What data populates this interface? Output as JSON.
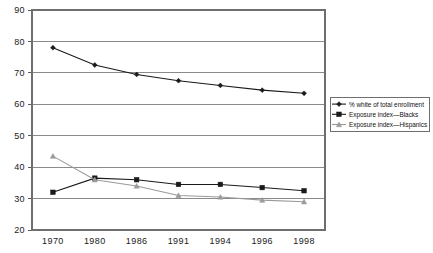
{
  "chart_data": {
    "type": "line",
    "title": "",
    "subtitle": "",
    "xlabel": "",
    "ylabel": "",
    "categories": [
      "1970",
      "1980",
      "1986",
      "1991",
      "1994",
      "1996",
      "1998"
    ],
    "ylim": [
      20,
      90
    ],
    "yticks": [
      "20",
      "30",
      "40",
      "50",
      "60",
      "70",
      "80",
      "90"
    ],
    "grid": true,
    "legend_position": "right",
    "series": [
      {
        "name": "% white of total enrollment",
        "marker": "diamond",
        "color": "#1a1a1a",
        "values": [
          78,
          72.5,
          69.5,
          67.5,
          66,
          64.5,
          63.5
        ]
      },
      {
        "name": "Exposure index—Blacks",
        "marker": "square",
        "color": "#1a1a1a",
        "values": [
          32,
          36.5,
          36,
          34.5,
          34.5,
          33.5,
          32.5
        ]
      },
      {
        "name": "Exposure index—Hispanics",
        "marker": "triangle",
        "color": "#9a9a9a",
        "values": [
          43.5,
          36,
          34,
          31,
          30.5,
          29.5,
          29
        ]
      }
    ]
  },
  "legend": {
    "items": [
      {
        "label": "% white of total enrollment"
      },
      {
        "label": "Exposure index—Blacks"
      },
      {
        "label": "Exposure index—Hispanics"
      }
    ]
  },
  "colors": {
    "grid": "#8a8a8a",
    "border": "#6e6e6e",
    "series_dark": "#1a1a1a",
    "series_gray": "#9a9a9a",
    "background": "#ffffff"
  }
}
